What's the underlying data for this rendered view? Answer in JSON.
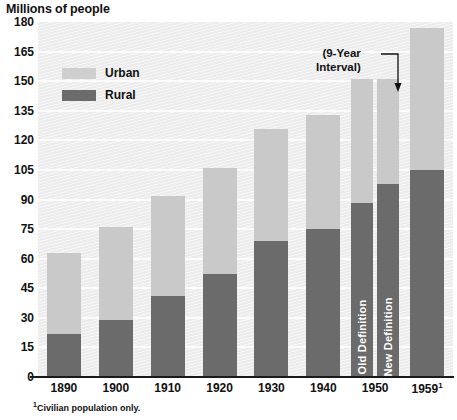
{
  "chart_data": {
    "type": "bar",
    "title": "Millions of people",
    "xlabel": "",
    "ylabel": "Millions of people",
    "ylim": [
      0,
      180
    ],
    "ytick_step": 15,
    "yticks": [
      180,
      165,
      150,
      135,
      120,
      105,
      90,
      75,
      60,
      45,
      30,
      15,
      0
    ],
    "grid": true,
    "stacked": true,
    "legend_position": "upper-left-inside",
    "categories": [
      "1890",
      "1900",
      "1910",
      "1920",
      "1930",
      "1940",
      "1950",
      "1959"
    ],
    "series": [
      {
        "name": "Rural",
        "color": "#6b6b6b",
        "values": [
          22,
          29,
          41,
          52,
          69,
          75,
          88,
          105
        ]
      },
      {
        "name": "Urban",
        "color": "#c9c9c9",
        "values": [
          41,
          47,
          51,
          54,
          57,
          58,
          63,
          72
        ]
      }
    ],
    "totals": [
      63,
      76,
      92,
      106,
      126,
      133,
      151,
      177
    ],
    "special_columns": [
      {
        "category": "1950",
        "note": "Split column showing two population definitions with same total",
        "sub_bars": [
          {
            "label": "Old Definition",
            "rural": 88,
            "total": 151
          },
          {
            "label": "New Definition",
            "rural": 98,
            "total": 151
          }
        ]
      }
    ],
    "annotations": [
      {
        "text_line_1": "(9-Year",
        "text_line_2": "Interval)",
        "points_to": "gap between 1950 and 1959"
      }
    ],
    "footnote": "Civilian population only.",
    "footnote_marker": "1",
    "last_category_marker": "1"
  },
  "legend": {
    "items": [
      {
        "label": "Urban",
        "swatch": "urban-swatch"
      },
      {
        "label": "Rural",
        "swatch": "rural-swatch"
      }
    ]
  },
  "annotation": {
    "line1": "(9-Year",
    "line2": "Interval)"
  },
  "vertical_labels": {
    "old": "Old Definition",
    "new": "New Definition"
  },
  "footnote": {
    "marker": "1",
    "text": "Civilian population only."
  },
  "colors": {
    "urban": "#c9c9c9",
    "rural": "#6b6b6b",
    "plot_background": "#ececec",
    "gridline": "#fbfbfb",
    "axis": "#1a1a1a",
    "text": "#111111"
  }
}
